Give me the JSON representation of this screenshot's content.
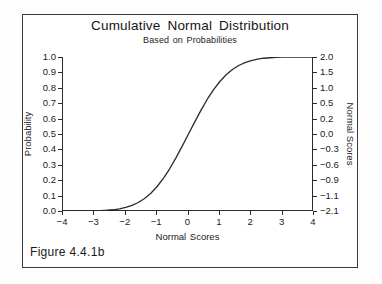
{
  "figure": {
    "caption": "Figure 4.4.1b"
  },
  "chart_data": {
    "type": "line",
    "title": "Cumulative Normal Distribution",
    "subtitle": "Based on Probabilities",
    "xlabel": "Normal Scores",
    "ylabel": "Probability",
    "y2label": "Normal Scores",
    "xlim": [
      -4,
      4
    ],
    "ylim": [
      0.0,
      1.0
    ],
    "grid": false,
    "legend": null,
    "xticks": [
      "-4",
      "-3",
      "-2",
      "-1",
      "0",
      "1",
      "2",
      "3",
      "4"
    ],
    "xtick_values": [
      -4,
      -3,
      -2,
      -1,
      0,
      1,
      2,
      3,
      4
    ],
    "yticks": [
      "1.0",
      "0.9",
      "0.8",
      "0.7",
      "0.6",
      "0.5",
      "0.4",
      "0.3",
      "0.2",
      "0.1",
      "0.0"
    ],
    "ytick_values": [
      1.0,
      0.9,
      0.8,
      0.7,
      0.6,
      0.5,
      0.4,
      0.3,
      0.2,
      0.1,
      0.0
    ],
    "y2ticks": [
      "2.0",
      "1.5",
      "1.0",
      "0.5",
      "0.2",
      "0.0",
      "-0.3",
      "-0.6",
      "-0.9",
      "-1.1",
      "-2.1"
    ],
    "y2tick_values": [
      2.0,
      1.5,
      1.0,
      0.5,
      0.2,
      0.0,
      -0.3,
      -0.6,
      -0.9,
      -1.1,
      -2.1
    ],
    "series": [
      {
        "name": "Cumulative normal probability",
        "color": "#2b2b2b",
        "x": [
          -4.0,
          -3.8,
          -3.6,
          -3.4,
          -3.2,
          -3.0,
          -2.8,
          -2.6,
          -2.4,
          -2.2,
          -2.0,
          -1.8,
          -1.6,
          -1.4,
          -1.2,
          -1.0,
          -0.8,
          -0.6,
          -0.4,
          -0.2,
          0.0,
          0.2,
          0.4,
          0.6,
          0.8,
          1.0,
          1.2,
          1.4,
          1.6,
          1.8,
          2.0,
          2.2,
          2.4,
          2.6,
          2.8,
          3.0,
          3.2,
          3.4,
          3.6,
          3.8,
          4.0
        ],
        "y": [
          0.0,
          0.0,
          0.0,
          0.0,
          0.001,
          0.001,
          0.003,
          0.005,
          0.008,
          0.014,
          0.023,
          0.036,
          0.055,
          0.081,
          0.115,
          0.159,
          0.212,
          0.274,
          0.345,
          0.421,
          0.5,
          0.579,
          0.655,
          0.726,
          0.788,
          0.841,
          0.885,
          0.919,
          0.945,
          0.964,
          0.977,
          0.986,
          0.992,
          0.995,
          0.997,
          0.999,
          0.999,
          1.0,
          1.0,
          1.0,
          1.0
        ]
      }
    ]
  }
}
